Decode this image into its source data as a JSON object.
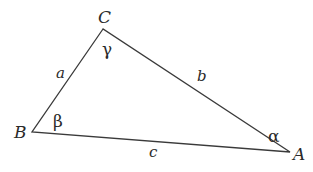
{
  "diagram": {
    "type": "triangle",
    "stroke_color": "#3a3a3a",
    "vertices": {
      "A": {
        "label": "A",
        "x": 290,
        "y": 152
      },
      "B": {
        "label": "B",
        "x": 32,
        "y": 132
      },
      "C": {
        "label": "C",
        "x": 103,
        "y": 29
      }
    },
    "sides": {
      "a": {
        "label": "a",
        "between": "B-C"
      },
      "b": {
        "label": "b",
        "between": "C-A"
      },
      "c": {
        "label": "c",
        "between": "B-A"
      }
    },
    "angles": {
      "alpha": {
        "label": "α",
        "at": "A"
      },
      "beta": {
        "label": "β",
        "at": "B"
      },
      "gamma": {
        "label": "γ",
        "at": "C"
      }
    }
  }
}
